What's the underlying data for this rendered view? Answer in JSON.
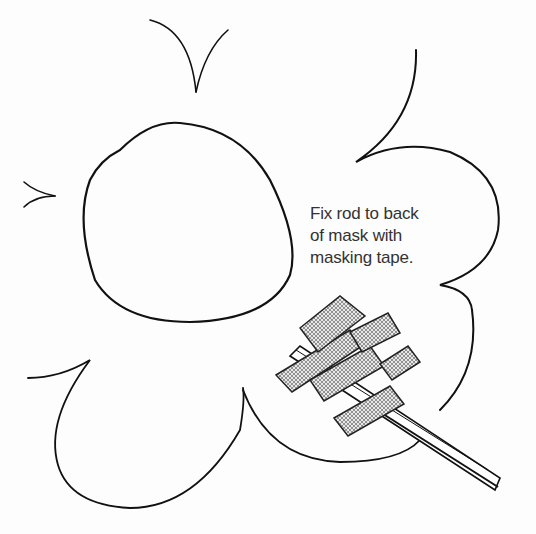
{
  "illustration": {
    "subject": "flower-shaped mask with rod attached by masking tape",
    "caption": {
      "lines": [
        "Fix rod to back",
        "of mask with",
        "masking tape."
      ]
    },
    "colors": {
      "background": "#fdfdfd",
      "line": "#111111",
      "text": "#333333",
      "hatch": "#555555"
    }
  }
}
